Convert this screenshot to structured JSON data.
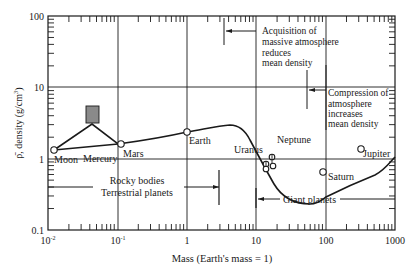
{
  "chart_data": {
    "type": "line",
    "title": "",
    "xlabel": "Mass  (Earth's mass = 1)",
    "ylabel": "ρ̄, density (g/cm³)",
    "xscale": "log",
    "yscale": "log",
    "xlim": [
      0.01,
      1000
    ],
    "ylim": [
      0.1,
      100
    ],
    "grid": "major decades",
    "x_tick_labels": [
      "10⁻²",
      "10⁻¹",
      "1",
      "10",
      "100",
      "1000"
    ],
    "y_tick_labels": [
      "0.1",
      "1",
      "10",
      "100"
    ],
    "points": [
      {
        "name": "Moon",
        "mass": 0.0123,
        "density": 3.3
      },
      {
        "name": "Mercury",
        "mass": 0.055,
        "density": 4.3,
        "note": "shaded box range ~3.7–5.5"
      },
      {
        "name": "Mars",
        "mass": 0.107,
        "density": 3.9
      },
      {
        "name": "Earth",
        "mass": 1.0,
        "density": 5.5
      },
      {
        "name": "Uranus",
        "mass": 14.5,
        "density": 1.3
      },
      {
        "name": "Neptune",
        "mass": 17.1,
        "density": 1.6
      },
      {
        "name": "Saturn",
        "mass": 95,
        "density": 0.69
      },
      {
        "name": "Jupiter",
        "mass": 318,
        "density": 1.33
      }
    ],
    "curve": {
      "x": [
        0.0123,
        0.055,
        0.107,
        0.3,
        1.0,
        2.5,
        4,
        8,
        15,
        25,
        45,
        70,
        95,
        200,
        318,
        1000
      ],
      "y": [
        3.3,
        3.7,
        3.9,
        4.4,
        5.5,
        6.6,
        6.0,
        3.2,
        1.6,
        0.95,
        0.7,
        0.64,
        0.69,
        1.0,
        1.33,
        2.8
      ]
    },
    "annotations": [
      {
        "text": "Acquisition of massive atmosphere reduces mean density",
        "arrow_at_mass": 3.5
      },
      {
        "text": "Compression of atmosphere increases mean density",
        "arrow_at_mass": 40
      },
      {
        "text": "Rocky bodies Terrestrial planets",
        "range_end_mass": 3.0
      },
      {
        "text": "Giant planets",
        "range_start_mass": 10
      }
    ]
  },
  "axes": {
    "xlabel": "Mass  (Earth's mass = 1)",
    "ylabel_prefix": "ρ̄, density (g/cm",
    "ylabel_sup": "3",
    "ylabel_suffix": ")",
    "x_ticks": [
      {
        "base": "10",
        "exp": "-2"
      },
      {
        "base": "10",
        "exp": "-1"
      },
      {
        "base": "1",
        "exp": ""
      },
      {
        "base": "10",
        "exp": ""
      },
      {
        "base": "100",
        "exp": ""
      },
      {
        "base": "1000",
        "exp": ""
      }
    ],
    "y_ticks": [
      "100",
      "10",
      "1",
      "0.1"
    ]
  },
  "labels": {
    "moon": "Moon",
    "mercury": "Mercury",
    "mars": "Mars",
    "earth": "Earth",
    "uranus": "Uranus",
    "neptune": "Neptune",
    "saturn": "Saturn",
    "jupiter": "Jupiter"
  },
  "annotations": {
    "acquisition": [
      "Acquisition of",
      "massive atmosphere",
      "reduces",
      "mean density"
    ],
    "compression": [
      "Compression of",
      "atmosphere",
      "increases",
      "mean density"
    ],
    "rocky": [
      "Rocky bodies",
      "Terrestrial planets"
    ],
    "giant": "Giant planets"
  },
  "colors": {
    "line": "#1a1a1a",
    "mercury_box": "#8a8a8a",
    "background": "#ffffff"
  }
}
